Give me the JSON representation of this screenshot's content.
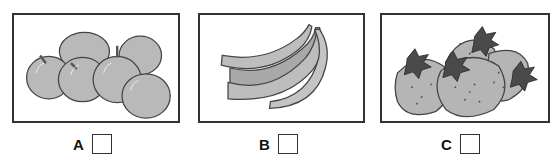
{
  "options": [
    {
      "letter": "A",
      "picture": "apples",
      "checked": false
    },
    {
      "letter": "B",
      "picture": "bananas",
      "checked": false
    },
    {
      "letter": "C",
      "picture": "strawberries",
      "checked": false
    }
  ],
  "colors": {
    "border": "#333333",
    "fruit_fill": "#b8b8b8",
    "leaf_fill": "#4a4a4a"
  }
}
